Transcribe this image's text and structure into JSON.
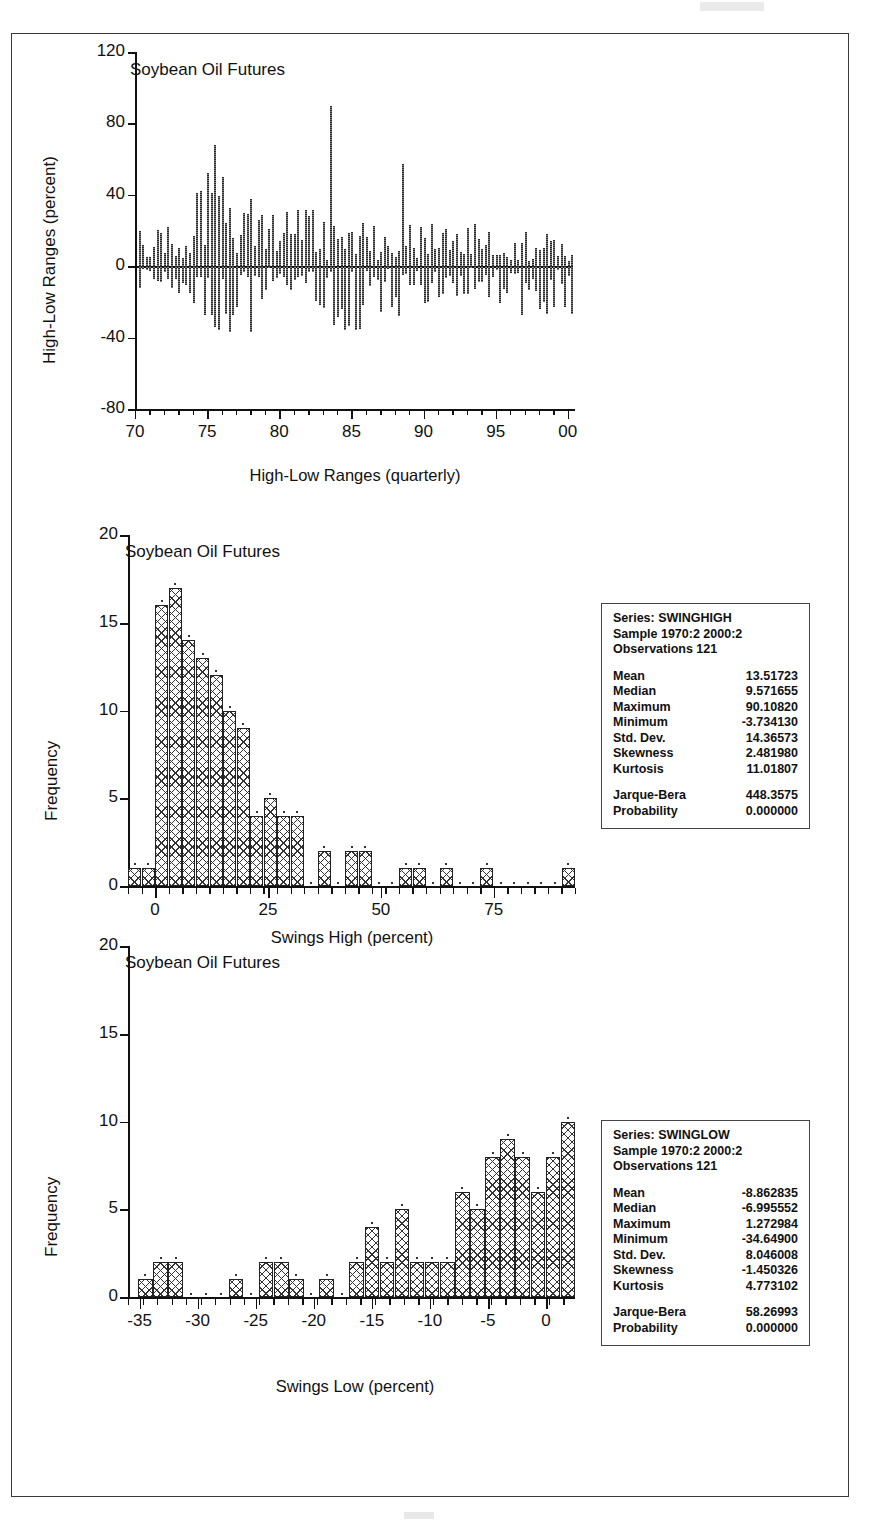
{
  "figure": {
    "outer_border_color": "#3a3a3a"
  },
  "chart_data": [
    {
      "type": "bar",
      "id": "high-low-ranges",
      "title": "Soybean Oil Futures",
      "xlabel": "High-Low Ranges (quarterly)",
      "ylabel": "High-Low Ranges (percent)",
      "ylim": [
        -80,
        120
      ],
      "yticks": [
        "120",
        "80",
        "40",
        "0",
        "-40",
        "-80"
      ],
      "ytick_values": [
        120,
        80,
        40,
        0,
        -40,
        -80
      ],
      "xlim": [
        1970,
        2000.5
      ],
      "xticks": [
        "70",
        "75",
        "80",
        "85",
        "90",
        "95",
        "00"
      ],
      "xtick_values": [
        1970,
        1975,
        1980,
        1985,
        1990,
        1995,
        2000
      ],
      "grid": false,
      "legend": "none",
      "note": "Quarterly high-low range spikes, 1970:2 through 2000:2 (121 observations)",
      "values": [
        22,
        12,
        18,
        9,
        16,
        20,
        16,
        10,
        2,
        -2,
        6,
        4,
        3,
        52,
        41,
        42,
        68,
        23,
        24,
        50,
        26,
        14,
        16,
        39,
        12,
        18,
        30,
        34,
        14,
        20,
        24,
        12,
        10,
        16,
        7,
        15,
        11,
        9,
        18,
        14,
        16,
        10,
        20,
        12,
        8,
        16,
        6,
        14,
        90,
        13,
        20,
        33,
        18,
        10,
        6,
        12,
        8,
        16,
        20,
        18,
        57,
        22,
        12,
        8,
        15,
        19,
        10,
        6,
        13,
        9,
        18,
        22,
        14,
        10,
        12,
        16,
        25,
        9,
        14,
        21,
        12,
        8,
        16,
        10,
        13,
        17,
        11,
        14,
        19,
        9,
        12,
        7,
        15,
        11,
        10,
        14,
        8,
        12,
        16,
        9,
        11,
        13,
        7,
        10,
        14,
        8,
        12,
        16,
        -8,
        -12,
        -6,
        -14,
        -10,
        -4,
        -16,
        -9,
        -18,
        -11,
        -7,
        -13,
        -36
      ],
      "negative_values": [
        -4,
        -9,
        -6,
        -11,
        -5,
        -8,
        -3,
        -7,
        -12,
        -15,
        -9,
        -6,
        -10,
        -14,
        -8,
        -20,
        -12,
        -22,
        -16,
        -30,
        -34,
        -36,
        -26,
        -12,
        -18,
        -37,
        -10,
        -14,
        -8,
        -24,
        -12,
        -20,
        -16,
        -9,
        -22,
        -13,
        -7,
        -11,
        -18,
        -6,
        -14,
        -9,
        -12,
        -8,
        -17,
        -10,
        -25,
        -15,
        -8,
        -35,
        -20,
        -12,
        -18,
        -24,
        -36,
        -9,
        -14,
        -30,
        -11,
        -16,
        -8,
        -12,
        -20,
        -6,
        -14,
        -10,
        -18,
        -7,
        -13,
        -9,
        -16,
        -11,
        -8,
        -14,
        -6,
        -12,
        -9,
        -15,
        -10,
        -7,
        -13,
        -11,
        -8,
        -14,
        -9,
        -12,
        -6,
        -10,
        -15,
        -8,
        -11,
        -27,
        -13,
        -9,
        -16,
        -12
      ]
    },
    {
      "type": "bar",
      "id": "swings-high-histogram",
      "title": "Soybean Oil Futures",
      "xlabel": "Swings High (percent)",
      "ylabel": "Frequency",
      "ylim": [
        0,
        20
      ],
      "yticks": [
        "0",
        "5",
        "10",
        "15",
        "20"
      ],
      "ytick_values": [
        0,
        5,
        10,
        15,
        20
      ],
      "xlim": [
        -6,
        93
      ],
      "xticks": [
        "0",
        "25",
        "50",
        "75"
      ],
      "xtick_values": [
        0,
        25,
        50,
        75
      ],
      "grid": false,
      "legend": "none",
      "bin_centers": [
        -4.5,
        -1.5,
        1.5,
        4.5,
        7.5,
        10.5,
        13.5,
        16.5,
        19.5,
        22.5,
        25.5,
        28.5,
        31.5,
        34.5,
        37.5,
        40.5,
        43.5,
        46.5,
        49.5,
        52.5,
        55.5,
        58.5,
        61.5,
        64.5,
        67.5,
        70.5,
        73.5,
        76.5,
        79.5,
        82.5,
        85.5,
        88.5,
        91.5
      ],
      "values": [
        1,
        1,
        16,
        17,
        14,
        13,
        12,
        10,
        9,
        4,
        5,
        4,
        4,
        0,
        2,
        0,
        2,
        2,
        0,
        0,
        1,
        1,
        0,
        1,
        0,
        0,
        1,
        0,
        0,
        0,
        0,
        0,
        1
      ]
    },
    {
      "type": "bar",
      "id": "swings-low-histogram",
      "title": "Soybean Oil Futures",
      "xlabel": "Swings Low (percent)",
      "ylabel": "Frequency",
      "ylim": [
        0,
        20
      ],
      "yticks": [
        "0",
        "5",
        "10",
        "15",
        "20"
      ],
      "ytick_values": [
        0,
        5,
        10,
        15,
        20
      ],
      "xlim": [
        -36,
        2.5
      ],
      "xticks": [
        "-35",
        "-30",
        "-25",
        "-20",
        "-15",
        "-10",
        "-5",
        "0"
      ],
      "xtick_values": [
        -35,
        -30,
        -25,
        -20,
        -15,
        -10,
        -5,
        0
      ],
      "grid": false,
      "legend": "none",
      "bin_centers": [
        -34.5,
        -33.2,
        -31.9,
        -30.6,
        -29.3,
        -28.0,
        -26.7,
        -25.4,
        -24.1,
        -22.8,
        -21.5,
        -20.2,
        -18.9,
        -17.6,
        -16.3,
        -15.0,
        -13.7,
        -12.4,
        -11.1,
        -9.8,
        -8.5,
        -7.2,
        -5.9,
        -4.6,
        -3.3,
        -2.0,
        -0.7,
        0.6,
        1.9
      ],
      "values": [
        1,
        2,
        2,
        0,
        0,
        0,
        1,
        0,
        2,
        2,
        1,
        0,
        1,
        0,
        2,
        4,
        2,
        5,
        2,
        2,
        2,
        6,
        5,
        8,
        9,
        8,
        6,
        8,
        10,
        5,
        15,
        6,
        1
      ]
    }
  ],
  "stats_boxes": [
    {
      "id": "swinghigh",
      "series_line": "Series: SWINGHIGH",
      "sample_line": "Sample 1970:2 2000:2",
      "observations_line": "Observations 121",
      "rows": [
        {
          "label": "Mean",
          "value": "13.51723"
        },
        {
          "label": "Median",
          "value": "9.571655"
        },
        {
          "label": "Maximum",
          "value": "90.10820"
        },
        {
          "label": "Minimum",
          "value": "-3.734130"
        },
        {
          "label": "Std. Dev.",
          "value": "14.36573"
        },
        {
          "label": "Skewness",
          "value": "2.481980"
        },
        {
          "label": "Kurtosis",
          "value": "11.01807"
        }
      ],
      "tests": [
        {
          "label": "Jarque-Bera",
          "value": "448.3575"
        },
        {
          "label": "Probability",
          "value": "0.000000"
        }
      ]
    },
    {
      "id": "swinglow",
      "series_line": "Series: SWINGLOW",
      "sample_line": "Sample 1970:2 2000:2",
      "observations_line": "Observations 121",
      "rows": [
        {
          "label": "Mean",
          "value": "-8.862835"
        },
        {
          "label": "Median",
          "value": "-6.995552"
        },
        {
          "label": "Maximum",
          "value": "1.272984"
        },
        {
          "label": "Minimum",
          "value": "-34.64900"
        },
        {
          "label": "Std. Dev.",
          "value": "8.046008"
        },
        {
          "label": "Skewness",
          "value": "-1.450326"
        },
        {
          "label": "Kurtosis",
          "value": "4.773102"
        }
      ],
      "tests": [
        {
          "label": "Jarque-Bera",
          "value": "58.26993"
        },
        {
          "label": "Probability",
          "value": "0.000000"
        }
      ]
    }
  ]
}
